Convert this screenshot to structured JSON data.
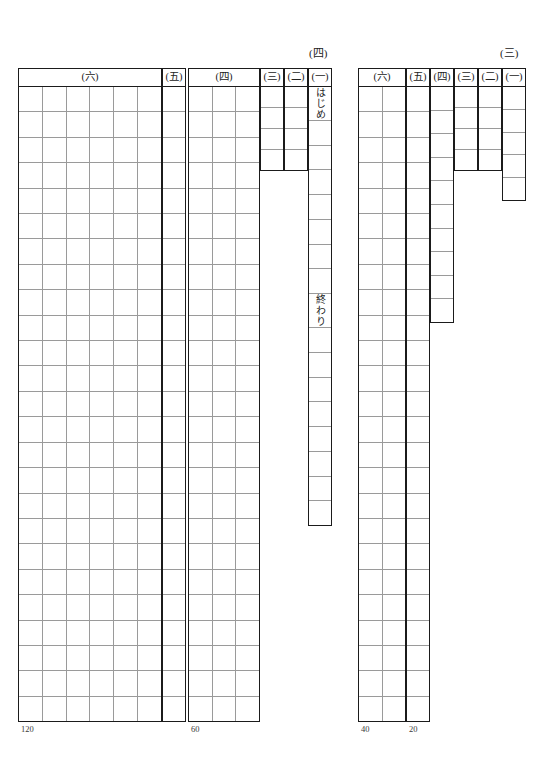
{
  "page": {
    "width": 548,
    "height": 763,
    "background": "#ffffff",
    "ink": "#1b1b1b",
    "rule": "#9a9a9a"
  },
  "blocks": [
    {
      "id": "block-four",
      "label": "(四)",
      "label_pos": {
        "x": 309,
        "y": 44
      },
      "groups": [
        {
          "id": "g4-6",
          "header": "(六)",
          "columns": 6,
          "rows": 25,
          "count_label": "120",
          "rect": {
            "x": 18,
            "y": 68,
            "w": 144,
            "h": 654
          }
        },
        {
          "id": "g4-5",
          "header": "(五)",
          "columns": 1,
          "rows": 25,
          "count_label": "",
          "rect": {
            "x": 162,
            "y": 68,
            "w": 24,
            "h": 654
          }
        },
        {
          "id": "g4-4",
          "header": "(四)",
          "columns": 3,
          "rows": 25,
          "count_label": "60",
          "rect": {
            "x": 188,
            "y": 68,
            "w": 72,
            "h": 654
          }
        },
        {
          "id": "g4-3",
          "header": "(三)",
          "columns": 1,
          "rows": 4,
          "count_label": "",
          "rect": {
            "x": 260,
            "y": 68,
            "w": 24,
            "h": 103
          }
        },
        {
          "id": "g4-2",
          "header": "(二)",
          "columns": 1,
          "rows": 4,
          "count_label": "",
          "rect": {
            "x": 284,
            "y": 68,
            "w": 24,
            "h": 103
          }
        },
        {
          "id": "g4-1",
          "header": "(一)",
          "columns": 1,
          "rows": 17,
          "count_label": "",
          "rect": {
            "x": 308,
            "y": 68,
            "w": 24,
            "h": 458
          },
          "cell_texts": {
            "0": "はじめ",
            "8": "終わり"
          }
        }
      ]
    },
    {
      "id": "block-three",
      "label": "(三)",
      "label_pos": {
        "x": 500,
        "y": 44
      },
      "groups": [
        {
          "id": "g3-6",
          "header": "(六)",
          "columns": 2,
          "rows": 25,
          "count_label": "40",
          "rect": {
            "x": 358,
            "y": 68,
            "w": 48,
            "h": 654
          }
        },
        {
          "id": "g3-5",
          "header": "(五)",
          "columns": 1,
          "rows": 25,
          "count_label": "20",
          "rect": {
            "x": 406,
            "y": 68,
            "w": 24,
            "h": 654
          }
        },
        {
          "id": "g3-4",
          "header": "(四)",
          "columns": 1,
          "rows": 10,
          "count_label": "",
          "rect": {
            "x": 430,
            "y": 68,
            "w": 24,
            "h": 255
          }
        },
        {
          "id": "g3-3",
          "header": "(三)",
          "columns": 1,
          "rows": 4,
          "count_label": "",
          "rect": {
            "x": 454,
            "y": 68,
            "w": 24,
            "h": 103
          }
        },
        {
          "id": "g3-2",
          "header": "(二)",
          "columns": 1,
          "rows": 4,
          "count_label": "",
          "rect": {
            "x": 478,
            "y": 68,
            "w": 24,
            "h": 103
          }
        },
        {
          "id": "g3-1",
          "header": "(一)",
          "columns": 1,
          "rows": 5,
          "count_label": "",
          "rect": {
            "x": 502,
            "y": 68,
            "w": 24,
            "h": 133
          }
        }
      ]
    }
  ]
}
